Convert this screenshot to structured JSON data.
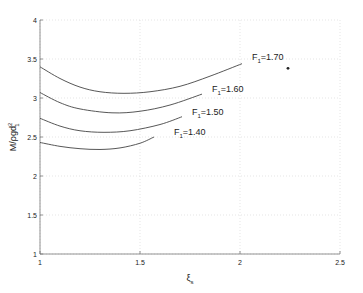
{
  "chart_data": {
    "type": "line",
    "title": "",
    "xlabel": "ξ",
    "xlabel_sub": "s",
    "ylabel": "M/ρgd",
    "ylabel_sub": "1",
    "ylabel_sup": "2",
    "xlim": [
      1,
      2.5
    ],
    "ylim": [
      1,
      4
    ],
    "xticks": [
      1,
      1.5,
      2,
      2.5
    ],
    "xtick_labels": [
      "1",
      "1.5",
      "2",
      "2.5"
    ],
    "yticks": [
      1,
      1.5,
      2,
      2.5,
      3,
      3.5,
      4
    ],
    "ytick_labels": [
      "1",
      "1.5",
      "2",
      "2.5",
      "3",
      "3.5",
      "4"
    ],
    "grid": true,
    "legend": "none (inline curve labels)",
    "series": [
      {
        "name": "F1=1.70",
        "label_prefix": "F",
        "label_sub": "1",
        "label_value": "=1.70",
        "x": [
          1.0,
          1.1,
          1.2,
          1.3,
          1.42,
          1.55,
          1.7,
          1.85,
          2.01
        ],
        "y": [
          3.4,
          3.25,
          3.14,
          3.08,
          3.06,
          3.08,
          3.15,
          3.28,
          3.44
        ],
        "label_pos": [
          2.06,
          3.49
        ]
      },
      {
        "name": "F1=1.60",
        "label_prefix": "F",
        "label_sub": "1",
        "label_value": "=1.60",
        "x": [
          1.0,
          1.1,
          1.2,
          1.36,
          1.5,
          1.65,
          1.81
        ],
        "y": [
          3.07,
          2.94,
          2.86,
          2.81,
          2.83,
          2.91,
          3.05
        ],
        "label_pos": [
          1.86,
          3.08
        ]
      },
      {
        "name": "F1=1.50",
        "label_prefix": "F",
        "label_sub": "1",
        "label_value": "=1.50",
        "x": [
          1.0,
          1.1,
          1.2,
          1.32,
          1.45,
          1.6,
          1.71
        ],
        "y": [
          2.74,
          2.64,
          2.58,
          2.56,
          2.58,
          2.66,
          2.76
        ],
        "label_pos": [
          1.76,
          2.78
        ]
      },
      {
        "name": "F1=1.40",
        "label_prefix": "F",
        "label_sub": "1",
        "label_value": "=1.40",
        "x": [
          1.0,
          1.1,
          1.2,
          1.3,
          1.4,
          1.5,
          1.57
        ],
        "y": [
          2.43,
          2.38,
          2.35,
          2.34,
          2.36,
          2.42,
          2.5
        ],
        "label_pos": [
          1.67,
          2.52
        ]
      }
    ],
    "annotations": [
      {
        "type": "point",
        "x": 2.24,
        "y": 3.38,
        "note": "isolated dark dot"
      }
    ]
  }
}
